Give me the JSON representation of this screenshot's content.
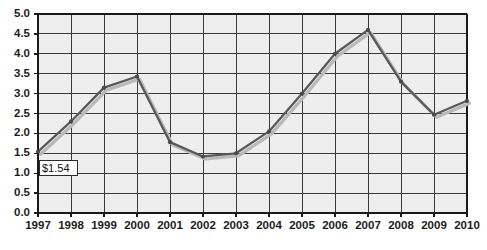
{
  "chart_data": {
    "type": "line",
    "title": "",
    "subtitle": "",
    "xlabel": "",
    "ylabel": "",
    "categories": [
      "1997",
      "1998",
      "1999",
      "2000",
      "2001",
      "2002",
      "2003",
      "2004",
      "2005",
      "2006",
      "2007",
      "2008",
      "2009",
      "2010"
    ],
    "x": [
      1997,
      1998,
      1999,
      2000,
      2001,
      2002,
      2003,
      2004,
      2005,
      2006,
      2007,
      2008,
      2009,
      2010
    ],
    "values": [
      1.54,
      2.3,
      3.15,
      3.43,
      1.78,
      1.42,
      1.5,
      2.05,
      3.0,
      4.0,
      4.6,
      3.3,
      2.47,
      2.82
    ],
    "series": [
      {
        "name": "series-1",
        "values": [
          1.54,
          2.3,
          3.15,
          3.43,
          1.78,
          1.42,
          1.5,
          2.05,
          3.0,
          4.0,
          4.6,
          3.3,
          2.47,
          2.82
        ],
        "color": "#595959",
        "shadow_color": "#b9b9b9"
      }
    ],
    "ylim": [
      0.0,
      5.0
    ],
    "ytick_step": 0.5,
    "ytick_labels": [
      "0.0",
      "0.5",
      "1.0",
      "1.5",
      "2.0",
      "2.5",
      "3.0",
      "3.5",
      "4.0",
      "4.5",
      "5.0"
    ],
    "ytick_values": [
      0.0,
      0.5,
      1.0,
      1.5,
      2.0,
      2.5,
      3.0,
      3.5,
      4.0,
      4.5,
      5.0
    ],
    "xtick_labels": [
      "1997",
      "1998",
      "1999",
      "2000",
      "2001",
      "2002",
      "2003",
      "2004",
      "2005",
      "2006",
      "2007",
      "2008",
      "2009",
      "2010"
    ],
    "grid": {
      "horizontal": true,
      "vertical": true,
      "color": "#3a3a3a"
    },
    "legend": {
      "visible": false,
      "position": "none"
    },
    "plot_background": "#eeeeee",
    "annotations": [
      {
        "name": "first-point-label",
        "text": "$1.54",
        "x": 1997,
        "y": 1.54
      }
    ]
  },
  "annotation_label": "$1.54"
}
